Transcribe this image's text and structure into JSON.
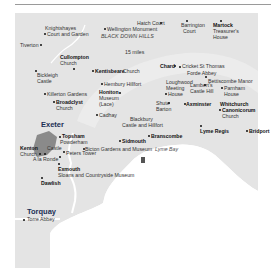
{
  "map": {
    "colors": {
      "land": "#e4e4e4",
      "sea": "#ffffff",
      "urban": "#8a8a8a",
      "urban_label": "#1b2f55",
      "rule": "#9a9a9a"
    },
    "scale_label": "15 miles",
    "area_labels": {
      "blackdown": "BLACK DOWN HILLS",
      "lyme_bay": "Lyme Bay"
    },
    "towns": {
      "exeter": "Exeter",
      "torquay": "Torquay",
      "tiverton": "Tiverton",
      "cullompton": "Cullompton",
      "honiton": "Honiton",
      "broadclyst": "Broadclyst",
      "chard": "Chard",
      "axminster": "Axminster",
      "whitchurch": "Whitchurch",
      "canonicorum": "Canonicorum",
      "lyme_regis": "Lyme Regis",
      "bridport": "Bridport",
      "sidmouth": "Sidmouth",
      "branscombe": "Branscombe",
      "topsham": "Topsham",
      "kenton": "Kenton",
      "exmouth": "Exmouth",
      "dawlish": "Dawlish",
      "martock": "Martock",
      "kentisbeare": "Kentisbeare"
    },
    "attractions": {
      "knightshayes_1": "Knightshayes",
      "knightshayes_2": "Court and Garden",
      "wellington": "Wellington Monument",
      "hatch_court": "Hatch Court",
      "barrington_1": "Barrington",
      "barrington_2": "Court",
      "martock_1": "Treasurer's",
      "martock_2": "House",
      "cullompton_church": "Church",
      "kentisbeare_church": "Church",
      "bickleigh_1": "Bickleigh",
      "bickleigh_2": "Castle",
      "cricket": "Cricket St Thomas",
      "forde": "Forde Abbey",
      "hembury": "Hembury Hillfort",
      "bettiscombe": "Bettiscombe Manor",
      "loughwood_1": "Loughwood",
      "loughwood_2": "Meeting",
      "loughwood_3": "House",
      "lamberts_1": "Lambert's",
      "lamberts_2": "Castle Hill",
      "parnham_1": "Parnham",
      "parnham_2": "House",
      "killerton": "Killerton Gardens",
      "honiton_1": "Museum",
      "honiton_2": "(Lace)",
      "broadclyst_church": "Church",
      "shute_1": "Shute",
      "shute_2": "Barton",
      "canonicorum_church": "Church",
      "cadhay": "Cadhay",
      "blackbury_1": "Blackbury",
      "blackbury_2": "Castle and Hillfort",
      "powderham_1": "Powderham",
      "powderham_2": "Castle",
      "kenton_church": "Church",
      "bicton": "Bicton Gardens and Museum",
      "peters_tower": "Peters Tower",
      "a_la_ronde": "A la Ronde",
      "exmouth_museum": "Sloans and Countryside Museum",
      "torre_abbey": "Torre Abbey"
    }
  }
}
